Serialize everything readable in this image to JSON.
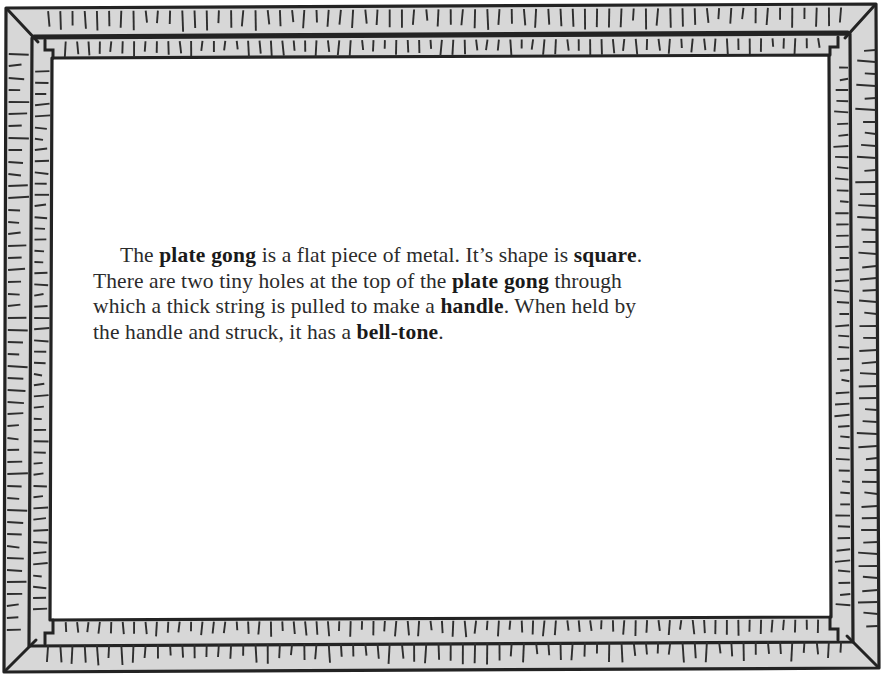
{
  "page": {
    "type": "scanned-book-page",
    "background_color": "#ffffff",
    "text_color": "#2b2b2b",
    "border": {
      "style": "hand-drawn double ruler frame with tick marks",
      "fill_color": "#d7d7d7",
      "line_color": "#232323",
      "bands": 2,
      "corner_joint": "mitered diagonal with notched step"
    }
  },
  "body": {
    "paragraph_runs": [
      {
        "text": "The ",
        "bold": false
      },
      {
        "text": "plate gong",
        "bold": true
      },
      {
        "text": " is a flat piece of metal. It’s shape is ",
        "bold": false
      },
      {
        "text": "square",
        "bold": true
      },
      {
        "text": ". There are two tiny holes at the top of the ",
        "bold": false
      },
      {
        "text": "plate gong",
        "bold": true
      },
      {
        "text": " through which a thick string is pulled to make a ",
        "bold": false
      },
      {
        "text": "handle",
        "bold": true
      },
      {
        "text": ". When held by the handle and struck, it has a ",
        "bold": false
      },
      {
        "text": "bell-tone",
        "bold": true
      },
      {
        "text": ".",
        "bold": false
      }
    ],
    "plain_text": "The plate gong is a flat piece of metal. It’s shape is square. There are two tiny holes at the top of the plate gong through which a thick string is pulled to make a handle. When held by the handle and struck, it has a bell-tone."
  }
}
